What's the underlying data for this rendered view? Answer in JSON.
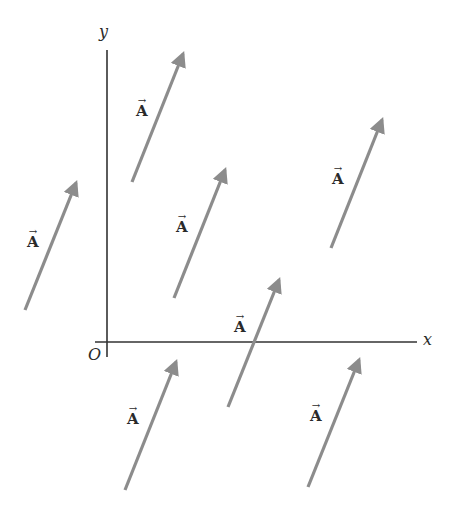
{
  "diagram": {
    "title": "",
    "axes": {
      "x_label": "x",
      "y_label": "y",
      "origin_label": "O",
      "axis_color": "#333333"
    },
    "vector_label": "A",
    "vector_arrow_glyph": "→",
    "arrow_color": "#8c8c8c",
    "vectors": [
      {
        "id": "v1",
        "from": [
          132,
          182
        ],
        "to": [
          183,
          54
        ],
        "label_pos": [
          136,
          98
        ]
      },
      {
        "id": "v2",
        "from": [
          25,
          310
        ],
        "to": [
          76,
          183
        ],
        "label_pos": [
          27,
          229
        ]
      },
      {
        "id": "v3",
        "from": [
          174,
          298
        ],
        "to": [
          225,
          170
        ],
        "label_pos": [
          176,
          214
        ]
      },
      {
        "id": "v4",
        "from": [
          331,
          248
        ],
        "to": [
          382,
          120
        ],
        "label_pos": [
          332,
          166
        ]
      },
      {
        "id": "v5",
        "from": [
          228,
          407
        ],
        "to": [
          279,
          280
        ],
        "label_pos": [
          234,
          314
        ]
      },
      {
        "id": "v6",
        "from": [
          125,
          490
        ],
        "to": [
          176,
          362
        ],
        "label_pos": [
          127,
          406
        ]
      },
      {
        "id": "v7",
        "from": [
          308,
          487
        ],
        "to": [
          359,
          360
        ],
        "label_pos": [
          310,
          403
        ]
      }
    ]
  }
}
